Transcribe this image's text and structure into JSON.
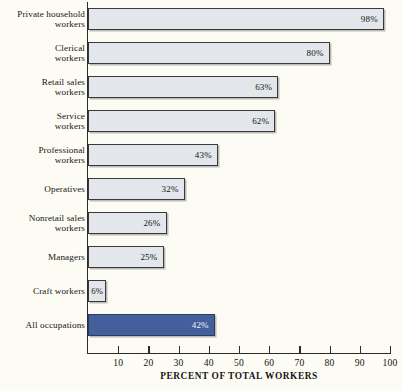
{
  "chart_data": {
    "type": "bar",
    "orientation": "horizontal",
    "title": "",
    "xlabel": "PERCENT OF TOTAL WORKERS",
    "ylabel": "",
    "xlim": [
      0,
      100
    ],
    "grid": false,
    "legend": "none",
    "categories": [
      "Private household workers",
      "Clerical workers",
      "Retail sales workers",
      "Service workers",
      "Professional workers",
      "Operatives",
      "Nonretail sales workers",
      "Managers",
      "Craft workers",
      "All occupations"
    ],
    "values": [
      98,
      80,
      63,
      62,
      43,
      32,
      26,
      25,
      6,
      42
    ],
    "value_labels": [
      "98%",
      "80%",
      "63%",
      "62%",
      "43%",
      "32%",
      "26%",
      "25%",
      "6%",
      "42%"
    ],
    "xticks": [
      10,
      20,
      30,
      40,
      50,
      60,
      70,
      80,
      90,
      100
    ],
    "xtick_labels": [
      "10",
      "20",
      "30",
      "40",
      "50",
      "60",
      "70",
      "80",
      "90",
      "100"
    ],
    "highlight_index": 9,
    "colors": {
      "background": "#fdfcf4",
      "bar_fill": "#e3e7ec",
      "bar_border": "#3a3a3a",
      "highlight_fill": "#44609c",
      "highlight_border": "#2b3c63",
      "axis": "#2b2b2b",
      "text": "#141414"
    }
  },
  "rows": [
    {
      "label_line1": "Private household",
      "label_line2": "workers",
      "value_label": "98%"
    },
    {
      "label_line1": "Clerical",
      "label_line2": "workers",
      "value_label": "80%"
    },
    {
      "label_line1": "Retail sales",
      "label_line2": "workers",
      "value_label": "63%"
    },
    {
      "label_line1": "Service",
      "label_line2": "workers",
      "value_label": "62%"
    },
    {
      "label_line1": "Professional",
      "label_line2": "workers",
      "value_label": "43%"
    },
    {
      "label_line1": "Operatives",
      "label_line2": "",
      "value_label": "32%"
    },
    {
      "label_line1": "Nonretail sales",
      "label_line2": "workers",
      "value_label": "26%"
    },
    {
      "label_line1": "Managers",
      "label_line2": "",
      "value_label": "25%"
    },
    {
      "label_line1": "Craft workers",
      "label_line2": "",
      "value_label": "6%"
    },
    {
      "label_line1": "All occupations",
      "label_line2": "",
      "value_label": "42%"
    }
  ]
}
